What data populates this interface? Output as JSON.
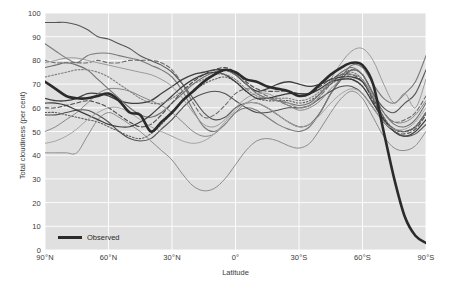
{
  "chart_data": {
    "type": "line",
    "title": "",
    "xlabel": "Latitude",
    "ylabel": "Total cloudiness (per cent)",
    "ylim": [
      0,
      100
    ],
    "ytick_values": [
      0,
      10,
      20,
      30,
      40,
      50,
      60,
      70,
      80,
      90,
      100
    ],
    "ytick_labels": [
      "0",
      "10",
      "20",
      "30",
      "40",
      "50",
      "60",
      "70",
      "80",
      "90",
      "100"
    ],
    "xlim": [
      90,
      -90
    ],
    "xtick_values": [
      90,
      60,
      30,
      0,
      -30,
      -60,
      -90
    ],
    "xtick_labels": [
      "90°N",
      "60°N",
      "30°N",
      "0°",
      "30°S",
      "60°S",
      "90°S"
    ],
    "grid": true,
    "grid_color": "#ffffff",
    "plot_background": "#e0e0e0",
    "legend_position": "bottom-left",
    "legend": [
      {
        "name": "Observed",
        "color": "#2b2b2b",
        "style": "solid",
        "width": 2.6
      }
    ],
    "x": [
      90,
      85,
      80,
      75,
      70,
      65,
      60,
      55,
      50,
      45,
      40,
      35,
      30,
      25,
      20,
      15,
      10,
      5,
      0,
      -5,
      -10,
      -15,
      -20,
      -25,
      -30,
      -35,
      -40,
      -45,
      -50,
      -55,
      -60,
      -65,
      -70,
      -75,
      -80,
      -85,
      -90
    ],
    "series": [
      {
        "name": "Observed",
        "color": "#2b2b2b",
        "style": "solid",
        "width": 2.6,
        "values": [
          71,
          68,
          65,
          64,
          64,
          65,
          66,
          63,
          58,
          57,
          50,
          54,
          58,
          63,
          67,
          71,
          74,
          76,
          75,
          72,
          71,
          69,
          68,
          67,
          65,
          66,
          70,
          74,
          77,
          79,
          78,
          70,
          50,
          30,
          14,
          6,
          3
        ]
      },
      {
        "name": "model-1",
        "color": "#555555",
        "style": "solid",
        "width": 1.1,
        "values": [
          96,
          96,
          96,
          95,
          93,
          90,
          89,
          87,
          85,
          82,
          80,
          78,
          75,
          70,
          64,
          58,
          55,
          56,
          60,
          62,
          62,
          60,
          57,
          54,
          52,
          53,
          58,
          66,
          72,
          76,
          74,
          66,
          60,
          58,
          62,
          66,
          76
        ]
      },
      {
        "name": "model-2",
        "color": "#7a7a7a",
        "style": "solid",
        "width": 1.1,
        "values": [
          87,
          84,
          81,
          79,
          82,
          83,
          83,
          82,
          81,
          80,
          78,
          76,
          73,
          67,
          59,
          52,
          50,
          53,
          58,
          60,
          59,
          56,
          53,
          51,
          50,
          52,
          58,
          66,
          73,
          78,
          77,
          70,
          64,
          62,
          66,
          71,
          82
        ]
      },
      {
        "name": "model-3",
        "color": "#6a6a6a",
        "style": "dashed",
        "width": 1.1,
        "values": [
          80,
          79,
          79,
          79,
          79,
          80,
          79,
          79,
          80,
          80,
          80,
          79,
          76,
          70,
          62,
          56,
          57,
          61,
          66,
          68,
          67,
          65,
          63,
          61,
          60,
          61,
          65,
          70,
          74,
          76,
          74,
          66,
          58,
          54,
          55,
          58,
          65
        ]
      },
      {
        "name": "model-4",
        "color": "#404040",
        "style": "solid",
        "width": 1.3,
        "values": [
          64,
          63,
          63,
          64,
          66,
          66,
          65,
          63,
          62,
          62,
          63,
          66,
          69,
          72,
          74,
          75,
          76,
          76,
          74,
          70,
          67,
          68,
          70,
          71,
          70,
          69,
          70,
          72,
          73,
          73,
          71,
          64,
          56,
          50,
          48,
          50,
          55
        ]
      },
      {
        "name": "model-5",
        "color": "#505050",
        "style": "solid",
        "width": 1.1,
        "values": [
          57,
          57,
          58,
          59,
          59,
          57,
          54,
          50,
          47,
          46,
          47,
          51,
          55,
          60,
          64,
          66,
          67,
          66,
          63,
          60,
          58,
          58,
          59,
          60,
          60,
          61,
          64,
          67,
          69,
          69,
          66,
          60,
          54,
          50,
          48,
          49,
          53
        ]
      },
      {
        "name": "model-6",
        "color": "#5e5e5e",
        "style": "dotted",
        "width": 1.1,
        "values": [
          58,
          58,
          57,
          56,
          55,
          54,
          52,
          50,
          48,
          47,
          49,
          53,
          58,
          63,
          67,
          70,
          72,
          73,
          71,
          67,
          64,
          63,
          63,
          63,
          62,
          63,
          66,
          70,
          72,
          72,
          69,
          62,
          55,
          51,
          50,
          52,
          58
        ]
      },
      {
        "name": "model-7",
        "color": "#8c8c8c",
        "style": "solid",
        "width": 1.0,
        "values": [
          41,
          41,
          41,
          41,
          48,
          55,
          58,
          56,
          53,
          50,
          46,
          42,
          38,
          32,
          27,
          25,
          26,
          30,
          36,
          42,
          46,
          47,
          46,
          44,
          43,
          45,
          51,
          58,
          64,
          67,
          64,
          56,
          48,
          43,
          42,
          44,
          50
        ]
      },
      {
        "name": "model-8",
        "color": "#6f6f6f",
        "style": "solid",
        "width": 1.1,
        "values": [
          77,
          78,
          79,
          78,
          76,
          72,
          68,
          64,
          60,
          57,
          56,
          58,
          62,
          66,
          70,
          73,
          75,
          76,
          74,
          70,
          66,
          64,
          63,
          62,
          61,
          62,
          66,
          71,
          75,
          77,
          74,
          66,
          58,
          53,
          52,
          55,
          62
        ]
      },
      {
        "name": "model-9",
        "color": "#9a9a9a",
        "style": "solid",
        "width": 1.0,
        "values": [
          79,
          80,
          81,
          81,
          80,
          79,
          78,
          77,
          76,
          75,
          74,
          72,
          69,
          64,
          58,
          53,
          52,
          55,
          60,
          64,
          66,
          66,
          64,
          62,
          60,
          61,
          65,
          72,
          79,
          84,
          85,
          80,
          70,
          62,
          66,
          60,
          72
        ]
      },
      {
        "name": "model-10",
        "color": "#4a4a4a",
        "style": "dashed",
        "width": 1.1,
        "values": [
          60,
          60,
          61,
          62,
          63,
          62,
          60,
          57,
          54,
          52,
          53,
          57,
          62,
          67,
          71,
          74,
          76,
          77,
          75,
          71,
          68,
          67,
          67,
          67,
          66,
          66,
          69,
          72,
          74,
          74,
          71,
          63,
          55,
          50,
          49,
          51,
          57
        ]
      },
      {
        "name": "model-11",
        "color": "#878787",
        "style": "solid",
        "width": 1.0,
        "values": [
          50,
          52,
          55,
          58,
          62,
          66,
          68,
          68,
          67,
          65,
          63,
          61,
          58,
          54,
          50,
          48,
          49,
          53,
          58,
          62,
          64,
          64,
          63,
          61,
          59,
          60,
          63,
          68,
          72,
          74,
          72,
          65,
          58,
          54,
          54,
          57,
          63
        ]
      },
      {
        "name": "model-12",
        "color": "#3d3d3d",
        "style": "solid",
        "width": 1.2,
        "values": [
          62,
          62,
          61,
          59,
          57,
          55,
          53,
          52,
          52,
          54,
          57,
          61,
          65,
          69,
          72,
          74,
          75,
          74,
          71,
          67,
          64,
          64,
          65,
          66,
          66,
          66,
          68,
          71,
          72,
          72,
          69,
          62,
          55,
          51,
          50,
          52,
          58
        ]
      },
      {
        "name": "model-13",
        "color": "#a5a5a5",
        "style": "solid",
        "width": 1.0,
        "values": [
          45,
          46,
          48,
          51,
          55,
          58,
          60,
          60,
          58,
          55,
          52,
          50,
          48,
          46,
          45,
          46,
          49,
          54,
          59,
          62,
          62,
          60,
          57,
          54,
          52,
          53,
          57,
          62,
          66,
          68,
          66,
          60,
          54,
          51,
          51,
          54,
          60
        ]
      },
      {
        "name": "model-14",
        "color": "#7e7e7e",
        "style": "dotted",
        "width": 1.1,
        "values": [
          73,
          74,
          75,
          76,
          76,
          75,
          73,
          70,
          67,
          64,
          62,
          62,
          64,
          67,
          70,
          72,
          74,
          74,
          72,
          68,
          65,
          64,
          64,
          64,
          63,
          64,
          67,
          71,
          74,
          75,
          72,
          64,
          56,
          51,
          50,
          52,
          58
        ]
      }
    ],
    "annotations": []
  }
}
